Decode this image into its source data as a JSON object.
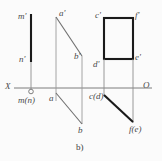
{
  "figure": {
    "caption": "b)",
    "background_color": "#fbfbfb",
    "thick_line_color": "#1a1a1a",
    "thin_line_color": "#8c8c8c",
    "axis_color": "#7d7d7d",
    "label_color": "#4a4a4a"
  },
  "axis": {
    "name": "projection-axis",
    "left_label": "X",
    "right_label": "O",
    "y": 88,
    "x_start": 14,
    "x_end": 152
  },
  "labels": {
    "m_prime": "m'",
    "n_prime": "n'",
    "m_n": "m(n)",
    "a_prime": "a'",
    "b_prime": "b'",
    "a": "a",
    "b": "b",
    "c_prime": "c'",
    "f_prime": "f'",
    "d_prime": "d'",
    "e_prime": "e'",
    "c_d": "c(d)",
    "f_e": "f(e)"
  },
  "geometry": {
    "line_mn": {
      "name": "segment-m-prime-n-prime",
      "x": 31,
      "y_top": 14,
      "y_bottom": 62,
      "weight": "thick"
    },
    "mn_extension": {
      "name": "projector-mn",
      "x": 31,
      "y_top": 62,
      "y_bottom": 88
    },
    "point_mn": {
      "name": "point-m-n",
      "cx": 31,
      "cy": 91,
      "r": 2.2
    },
    "parallelogram": {
      "name": "parallelogram-abab",
      "left_x": 56,
      "right_x": 82,
      "top_y": 17,
      "diag_top_y": 17,
      "diag_bottom_y": 56,
      "lower_diag_top_y": 93,
      "lower_diag_bottom_y": 124,
      "bottom_y": 124
    },
    "rectangle": {
      "name": "rectangle-c-f-e-d",
      "left_x": 104,
      "right_x": 133,
      "top_y": 18,
      "bottom_y": 59,
      "weight": "thick"
    },
    "rect_projectors": {
      "name": "projectors-cdfe",
      "left_x": 104,
      "right_x": 133,
      "y_top": 59,
      "y_bottom": 122
    },
    "line_cdfe": {
      "name": "segment-c-d-f-e",
      "x1": 104,
      "y1": 95,
      "x2": 133,
      "y2": 122,
      "weight": "thick"
    }
  }
}
